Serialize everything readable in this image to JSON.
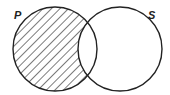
{
  "diagram": {
    "type": "venn",
    "sets": [
      {
        "label": "P",
        "shaded": "P only (P minus S)"
      },
      {
        "label": "S",
        "shaded": "none"
      }
    ],
    "shaded_region": "P - S"
  }
}
